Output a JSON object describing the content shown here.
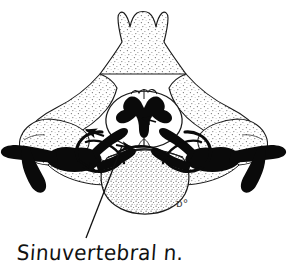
{
  "figure": {
    "kind": "anatomical-line-illustration",
    "subject": "Cervical vertebra axial cross-section showing the sinuvertebral nerve",
    "background_color": "#ffffff",
    "ink_color": "#111111",
    "stipple_color": "#6b6b6b",
    "nerve_fill_color": "#0a0a0a",
    "outline_color": "#1a1a1a",
    "width": 287,
    "height": 278
  },
  "caption": {
    "label": "Sinuvertebral n.",
    "x": 16,
    "y": 241,
    "style": "handwritten"
  },
  "leader_line": {
    "name": "caption-leader-line",
    "from_x": 86,
    "from_y": 238,
    "to_x": 122,
    "to_y": 146,
    "stroke_width": 1.3
  },
  "signature": {
    "monogram": "ᴅ°",
    "x": 176,
    "y": 207
  },
  "structures": [
    {
      "id": "spinous-process",
      "label": "Spinous process (bifid)",
      "fill": "stipple"
    },
    {
      "id": "lamina-left",
      "label": "Left lamina",
      "fill": "stipple"
    },
    {
      "id": "lamina-right",
      "label": "Right lamina",
      "fill": "stipple"
    },
    {
      "id": "vertebral-body",
      "label": "Vertebral body",
      "fill": "stipple"
    },
    {
      "id": "transverse-process-left",
      "label": "Left transverse process",
      "fill": "stipple"
    },
    {
      "id": "transverse-process-right",
      "label": "Right transverse process",
      "fill": "stipple"
    },
    {
      "id": "spinal-cord",
      "label": "Spinal cord",
      "fill": "white"
    },
    {
      "id": "gray-matter",
      "label": "Gray matter (butterfly)",
      "fill": "black"
    },
    {
      "id": "dorsal-root-ganglion-left",
      "label": "Left dorsal root ganglion",
      "fill": "black"
    },
    {
      "id": "dorsal-root-ganglion-right",
      "label": "Right dorsal root ganglion",
      "fill": "black"
    },
    {
      "id": "sinuvertebral-nerve-left",
      "label": "Left sinuvertebral nerve",
      "fill": "black"
    },
    {
      "id": "sinuvertebral-nerve-right",
      "label": "Right sinuvertebral nerve",
      "fill": "black"
    },
    {
      "id": "spinal-nerve-left",
      "label": "Left spinal nerve trunk",
      "fill": "black"
    },
    {
      "id": "spinal-nerve-right",
      "label": "Right spinal nerve trunk",
      "fill": "black"
    }
  ],
  "arrows": [
    {
      "id": "arrow-left-upper",
      "label": "Recurrent branch pointing left into canal"
    },
    {
      "id": "arrow-left-lower",
      "label": "Branch pointing laterally-down on left"
    },
    {
      "id": "arrow-center",
      "label": "Branch pointing toward midline of canal"
    },
    {
      "id": "arrow-center-low",
      "label": "Branch toward posterior vertebral body"
    }
  ]
}
